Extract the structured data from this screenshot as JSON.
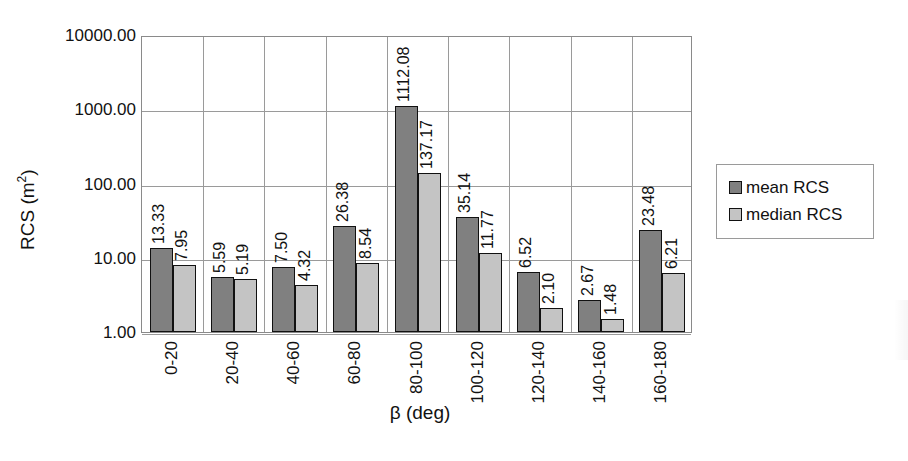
{
  "chart_data": {
    "type": "bar",
    "title": "",
    "xlabel": "β (deg)",
    "ylabel": "RCS (m²)",
    "ylabel_base": "RCS (m",
    "ylabel_sup": "2",
    "ylabel_close": ")",
    "yscale": "log",
    "ylim": [
      1,
      10000
    ],
    "ytick_labels": [
      "10000.00",
      "1000.00",
      "100.00",
      "10.00",
      "1.00"
    ],
    "ytick_values": [
      10000,
      1000,
      100,
      10,
      1
    ],
    "grid": true,
    "legend_position": "right",
    "categories": [
      "0-20",
      "20-40",
      "40-60",
      "60-80",
      "80-100",
      "100-120",
      "120-140",
      "140-160",
      "160-180"
    ],
    "series": [
      {
        "name": "mean RCS",
        "color": "#808080",
        "values": [
          13.33,
          5.59,
          7.5,
          26.38,
          1112.08,
          35.14,
          6.52,
          2.67,
          23.48
        ],
        "labels": [
          "13.33",
          "5.59",
          "7.50",
          "26.38",
          "1112.08",
          "35.14",
          "6.52",
          "2.67",
          "23.48"
        ]
      },
      {
        "name": "median RCS",
        "color": "#c4c4c4",
        "values": [
          7.95,
          5.19,
          4.32,
          8.54,
          137.17,
          11.77,
          2.1,
          1.48,
          6.21
        ],
        "labels": [
          "7.95",
          "5.19",
          "4.32",
          "8.54",
          "137.17",
          "11.77",
          "2.10",
          "1.48",
          "6.21"
        ]
      }
    ]
  },
  "legend": {
    "items": [
      {
        "label": "mean RCS",
        "swatch": "mean"
      },
      {
        "label": "median RCS",
        "swatch": "median"
      }
    ]
  },
  "colors": {
    "mean": "#808080",
    "median": "#c4c4c4",
    "bar_border": "#111111",
    "grid": "#9a9a9a",
    "axis": "#8a8a8a",
    "text": "#111111",
    "background": "#ffffff"
  }
}
